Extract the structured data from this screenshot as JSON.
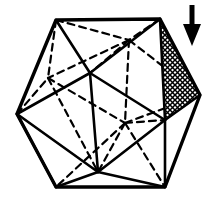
{
  "figure": {
    "type": "line-diagram",
    "canvas": {
      "width": 218,
      "height": 200,
      "background": "#ffffff"
    },
    "ink_color": "#000000",
    "shaded_face_fill": "crosshatch-pattern",
    "annotation_label": "",
    "solid_stroke_width": 2.6,
    "hidden_stroke_width": 2.2,
    "hidden_dash_pattern": "7,5",
    "vertices": {
      "top_left": {
        "name": "A",
        "x": 56,
        "y": 20,
        "kind": "visible"
      },
      "top_right": {
        "name": "B",
        "x": 160,
        "y": 19,
        "kind": "visible"
      },
      "right": {
        "name": "C",
        "x": 200,
        "y": 95,
        "kind": "visible"
      },
      "bottom_right": {
        "name": "D",
        "x": 165,
        "y": 187,
        "kind": "visible"
      },
      "bottom_left": {
        "name": "E",
        "x": 56,
        "y": 187,
        "kind": "visible"
      },
      "left": {
        "name": "F",
        "x": 17,
        "y": 114,
        "kind": "visible"
      },
      "front_upper_left": {
        "name": "G",
        "x": 90,
        "y": 73,
        "kind": "visible"
      },
      "front_right": {
        "name": "H",
        "x": 165,
        "y": 120,
        "kind": "visible"
      },
      "front_bottom": {
        "name": "I",
        "x": 98,
        "y": 172,
        "kind": "visible"
      },
      "back_upper_right": {
        "name": "J",
        "x": 129,
        "y": 40,
        "kind": "hidden"
      },
      "back_left": {
        "name": "K",
        "x": 48,
        "y": 78,
        "kind": "hidden"
      },
      "back_center_low": {
        "name": "L",
        "x": 125,
        "y": 123,
        "kind": "hidden"
      }
    },
    "edges_solid": [
      "A-B",
      "B-C",
      "C-D",
      "D-E",
      "E-F",
      "F-A",
      "A-G",
      "B-G",
      "F-G",
      "G-H",
      "G-I",
      "B-H",
      "C-H",
      "D-H",
      "H-I",
      "E-I",
      "D-I",
      "F-I"
    ],
    "edges_hidden": [
      "A-J",
      "B-J",
      "J-C",
      "J-K",
      "J-L",
      "J-G",
      "A-K",
      "F-K",
      "K-L",
      "K-I",
      "L-C",
      "L-H",
      "L-D",
      "L-E",
      "L-I"
    ],
    "shaded_face": {
      "points": "160,19 200,95 165,120",
      "label": "highlighted-face"
    },
    "arrow": {
      "label": "downward-arrow",
      "direction": "down",
      "shaft_x": 192,
      "shaft_top_y": 5,
      "shaft_bottom_y": 28,
      "head_tip_y": 46,
      "head_half_width": 9
    }
  }
}
